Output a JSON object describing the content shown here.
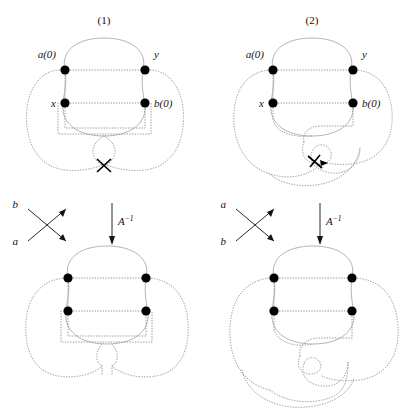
{
  "figure": {
    "background": "#ffffff",
    "ink_dark": "#111111",
    "ink_curve_dotted": "#9a9a9a",
    "ink_curve_solid": "#b4b4b4",
    "vertex_color": "#000000"
  },
  "panels": [
    {
      "id": "panel-1",
      "title": "(1)",
      "vertex_labels": {
        "top_left": "a(0)",
        "top_right": "y",
        "bottom_left": "x",
        "bottom_right": "b(0)"
      },
      "crossing_marker": "x-crossing",
      "crossing_legend": {
        "upper_left": "b",
        "lower_left": "a"
      },
      "transform_label": "A",
      "transform_exponent": "−1"
    },
    {
      "id": "panel-2",
      "title": "(2)",
      "vertex_labels": {
        "top_left": "a(0)",
        "top_right": "y",
        "bottom_left": "x",
        "bottom_right": "b(0)"
      },
      "crossing_marker": "arrow-crossing",
      "crossing_legend": {
        "upper_left": "a",
        "lower_left": "b"
      },
      "transform_label": "A",
      "transform_exponent": "−1"
    }
  ]
}
